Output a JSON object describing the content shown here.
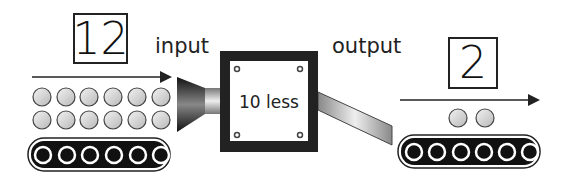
{
  "input": {
    "number": "12",
    "label": "input",
    "balls": 12
  },
  "machine": {
    "rule": "10 less"
  },
  "output": {
    "number": "2",
    "label": "output",
    "balls": 2
  },
  "colors": {
    "stroke": "#222222",
    "ball": "#d4d4d4",
    "belt": "#111111"
  }
}
